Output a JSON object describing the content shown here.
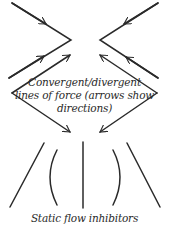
{
  "diagram": {
    "force_caption": {
      "line1": "Convergent/divergent",
      "line2": "lines of force (arrows show",
      "line3": "directions)"
    },
    "inhibitor_caption": "Static flow inhibitors",
    "stroke_color": "#2a2a2a",
    "background_color": "#ffffff"
  }
}
